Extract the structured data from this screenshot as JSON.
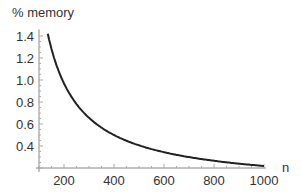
{
  "chart_data": {
    "type": "line",
    "title": "",
    "xlabel": "n",
    "ylabel": "% memory",
    "xlim": [
      100,
      1000
    ],
    "ylim": [
      0.2,
      1.45
    ],
    "xticks": [
      200,
      400,
      600,
      800,
      1000
    ],
    "yticks": [
      0.4,
      0.6,
      0.8,
      1.0,
      1.2,
      1.4
    ],
    "xtick_labels": [
      "200",
      "400",
      "600",
      "800",
      "1000"
    ],
    "ytick_labels": [
      "0.4",
      "0.6",
      "0.8",
      "1.0",
      "1.2",
      "1.4"
    ],
    "grid": false,
    "legend": null,
    "series": [
      {
        "name": "% memory",
        "color": "#222222",
        "x": [
          135,
          150,
          175,
          200,
          250,
          300,
          350,
          400,
          500,
          600,
          700,
          800,
          900,
          1000
        ],
        "y": [
          1.42,
          1.28,
          1.1,
          0.97,
          0.78,
          0.66,
          0.57,
          0.5,
          0.41,
          0.34,
          0.3,
          0.27,
          0.24,
          0.22
        ]
      }
    ]
  },
  "axis_labels": {
    "y": "% memory",
    "x": "n"
  }
}
